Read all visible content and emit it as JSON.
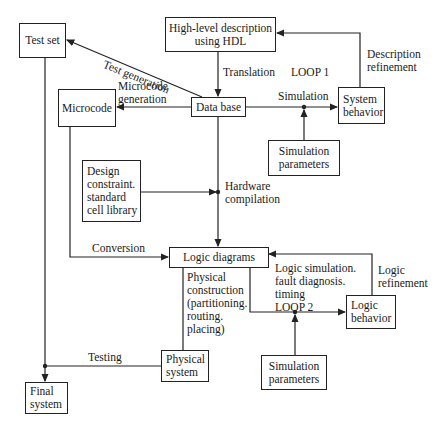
{
  "diagram": {
    "boxes": {
      "test_set": "Test set",
      "high_level": [
        "High-level description",
        "using HDL"
      ],
      "microcode": "Microcode",
      "data_base": "Data base",
      "system_behavior": [
        "System",
        "behavior"
      ],
      "sim_params_1": [
        "Simulation",
        "parameters"
      ],
      "design_constraint": [
        "Design",
        "constraint.",
        "standard",
        "cell library"
      ],
      "logic_diagrams": "Logic diagrams",
      "logic_behavior": [
        "Logic",
        "behavior"
      ],
      "sim_params_2": [
        "Simulation",
        "parameters"
      ],
      "physical_system": [
        "Physical",
        "system"
      ],
      "final_system": [
        "Final",
        "system"
      ]
    },
    "labels": {
      "test_generation": "Test generation",
      "microcode_generation": [
        "Microcode",
        "generation"
      ],
      "translation": "Translation",
      "loop1": "LOOP 1",
      "description_refinement": [
        "Description",
        "refinement"
      ],
      "simulation": "Simulation",
      "hardware_compilation": [
        "Hardware",
        "compilation"
      ],
      "conversion": "Conversion",
      "logic_sim": [
        "Logic simulation.",
        "fault diagnosis.",
        "timing",
        "LOOP 2"
      ],
      "logic_refinement": [
        "Logic",
        "refinement"
      ],
      "physical_construction": [
        "Physical",
        "construction",
        "(partitioning.",
        "routing.",
        "placing)"
      ],
      "testing": "Testing"
    }
  }
}
